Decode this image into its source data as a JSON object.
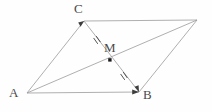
{
  "figure": {
    "kind": "geometry-diagram",
    "background_color": "#fefefe",
    "stroke_color": "#9a9a9a",
    "label_color": "#4a4a4a",
    "point_color": "#1a1a1a",
    "stroke_width": 0.8,
    "canvas": {
      "width": 212,
      "height": 112
    }
  },
  "points": [
    {
      "id": "A",
      "label": "A",
      "x": 27,
      "y": 93,
      "label_x": 9,
      "label_y": 86,
      "dot": false
    },
    {
      "id": "C",
      "label": "C",
      "x": 84,
      "y": 21,
      "label_x": 74,
      "label_y": 2,
      "dot": false
    },
    {
      "id": "D",
      "label": "",
      "x": 197,
      "y": 20,
      "label_x": 0,
      "label_y": 0,
      "dot": false
    },
    {
      "id": "B",
      "label": "B",
      "x": 139,
      "y": 92,
      "label_x": 143,
      "label_y": 88,
      "dot": false
    },
    {
      "id": "M",
      "label": "M",
      "x": 110,
      "y": 60,
      "label_x": 104,
      "label_y": 41,
      "dot": true
    }
  ],
  "segments": [
    {
      "id": "AC",
      "from": "A",
      "to": "C",
      "role": "side",
      "arrow_at_end": true
    },
    {
      "id": "CD",
      "from": "C",
      "to": "D",
      "role": "side",
      "arrow_at_end": false
    },
    {
      "id": "AB",
      "from": "A",
      "to": "B",
      "role": "side",
      "arrow_at_end": true
    },
    {
      "id": "BD",
      "from": "B",
      "to": "D",
      "role": "side",
      "arrow_at_end": false
    },
    {
      "id": "CB",
      "from": "C",
      "to": "B",
      "role": "diagonal",
      "arrow_at_end": true
    },
    {
      "id": "AD",
      "from": "A",
      "to": "D",
      "role": "diagonal",
      "arrow_at_end": false
    }
  ],
  "tick_marks": [
    {
      "id": "tick-CM",
      "on_segment": "CB",
      "x": 97,
      "y": 40,
      "count": 2,
      "angle_deg": 55
    },
    {
      "id": "tick-MB",
      "on_segment": "CB",
      "x": 124,
      "y": 76,
      "count": 2,
      "angle_deg": 55
    }
  ]
}
